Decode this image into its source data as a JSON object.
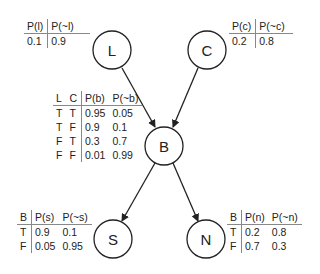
{
  "nodes": {
    "L": {
      "label": "L"
    },
    "C": {
      "label": "C"
    },
    "B": {
      "label": "B"
    },
    "S": {
      "label": "S"
    },
    "N": {
      "label": "N"
    }
  },
  "edges": [
    {
      "from": "L",
      "to": "B"
    },
    {
      "from": "C",
      "to": "B"
    },
    {
      "from": "B",
      "to": "S"
    },
    {
      "from": "B",
      "to": "N"
    }
  ],
  "cpt_l": {
    "headers": [
      "P(l)",
      "P(~l)"
    ],
    "rows": [
      [
        "0.1",
        "0.9"
      ]
    ]
  },
  "cpt_c": {
    "headers": [
      "P(c)",
      "P(~c)"
    ],
    "rows": [
      [
        "0.2",
        "0.8"
      ]
    ]
  },
  "cpt_b": {
    "headers": [
      "L",
      "C",
      "P(b)",
      "P(~b)"
    ],
    "rows": [
      [
        "T",
        "T",
        "0.95",
        "0.05"
      ],
      [
        "T",
        "F",
        "0.9",
        "0.1"
      ],
      [
        "F",
        "T",
        "0.3",
        "0.7"
      ],
      [
        "F",
        "F",
        "0.01",
        "0.99"
      ]
    ]
  },
  "cpt_s": {
    "headers": [
      "B",
      "P(s)",
      "P(~s)"
    ],
    "rows": [
      [
        "T",
        "0.9",
        "0.1"
      ],
      [
        "F",
        "0.05",
        "0.95"
      ]
    ]
  },
  "cpt_n": {
    "headers": [
      "B",
      "P(n)",
      "P(~n)"
    ],
    "rows": [
      [
        "T",
        "0.2",
        "0.8"
      ],
      [
        "F",
        "0.7",
        "0.3"
      ]
    ]
  }
}
